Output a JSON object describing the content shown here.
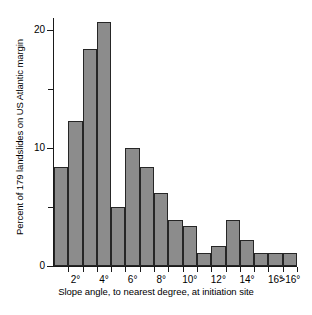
{
  "chart_data": {
    "type": "bar",
    "title": "",
    "subtitle": "",
    "xlabel": "Slope angle, to nearest degree, at initiation site",
    "ylabel": "Percent of 179 landslides on US Atlantic margin",
    "categories": [
      "1°",
      "2°",
      "3°",
      "4°",
      "5°",
      "6°",
      "7°",
      "8°",
      "9°",
      "10°",
      "11°",
      "12°",
      "13°",
      "14°",
      "15°",
      "16°",
      ">16°"
    ],
    "values": [
      8.4,
      12.3,
      18.4,
      20.7,
      5.0,
      10.0,
      8.4,
      6.2,
      3.9,
      3.4,
      1.1,
      1.7,
      3.9,
      2.2,
      1.1,
      1.1,
      1.1
    ],
    "ylim": [
      0,
      21
    ],
    "xlim": [
      0,
      17
    ],
    "grid": false,
    "legend": false,
    "legend_position": "none",
    "y_ticks_major": [
      0,
      10,
      20
    ],
    "y_ticks_minor": [
      5,
      15
    ],
    "y_tick_labels": [
      "0",
      "10",
      "20"
    ],
    "x_tick_labels": [
      "2°",
      "4°",
      "6°",
      "8°",
      "10°",
      "12°",
      "14°",
      "16°",
      ">16°"
    ],
    "x_tick_label_indices": [
      1,
      3,
      5,
      7,
      9,
      11,
      13,
      15,
      16
    ],
    "bar_fill_color": "#8c8c8c",
    "bar_edge_color": "#262626",
    "axis_color": "#1a1a1a",
    "background_color": "#ffffff"
  }
}
